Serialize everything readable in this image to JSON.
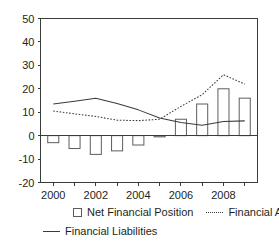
{
  "chart_data": {
    "type": "bar",
    "title": "",
    "xlabel": "",
    "ylabel": "",
    "categories": [
      2000,
      2001,
      2002,
      2003,
      2004,
      2005,
      2006,
      2007,
      2008,
      2009
    ],
    "xtick_labels": [
      "2000",
      "2002",
      "2004",
      "2006",
      "2008"
    ],
    "xticks": [
      2000,
      2002,
      2004,
      2006,
      2008
    ],
    "ytick_labels": [
      "50",
      "40",
      "30",
      "20",
      "10",
      "0",
      "-10",
      "-20"
    ],
    "yticks": [
      50,
      40,
      30,
      20,
      10,
      0,
      -10,
      -20
    ],
    "ylim": [
      -20,
      50
    ],
    "xlim": [
      1999.4,
      2009.6
    ],
    "grid": false,
    "legend_position": "bottom",
    "series": [
      {
        "name": "Net Financial Position",
        "kind": "bar",
        "marker": "open-square",
        "values": [
          -3.0,
          -5.5,
          -8.0,
          -6.5,
          -4.0,
          -0.5,
          7.0,
          13.5,
          20.0,
          16.0
        ]
      },
      {
        "name": "Financial Assets",
        "kind": "line",
        "marker": "dotted-line",
        "values": [
          10.5,
          9.3,
          8.2,
          6.6,
          6.4,
          7.0,
          12.5,
          17.5,
          26.0,
          22.0
        ]
      },
      {
        "name": "Financial Liabilities",
        "kind": "line",
        "marker": "solid-line",
        "values": [
          13.5,
          14.7,
          16.0,
          13.7,
          11.0,
          7.5,
          5.6,
          4.4,
          6.0,
          6.3
        ]
      }
    ]
  },
  "legend": {
    "items": [
      {
        "label": "Net Financial Position",
        "marker": "open-square"
      },
      {
        "label": "Financial Assets",
        "marker": "dotted-line"
      },
      {
        "label": "Financial Liabilities",
        "marker": "solid-line"
      }
    ]
  }
}
